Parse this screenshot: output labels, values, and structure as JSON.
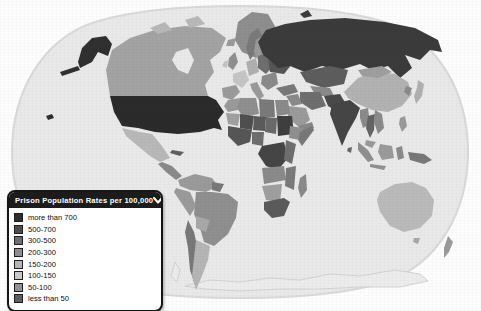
{
  "legend": {
    "title": "Prison Population Rates per 100,000",
    "chevron_icon": "chevron-down",
    "items": [
      {
        "label": "more than 700",
        "color": "#2e2e2e"
      },
      {
        "label": "500-700",
        "color": "#4d4d4d"
      },
      {
        "label": "300-500",
        "color": "#6e6e6e"
      },
      {
        "label": "200-300",
        "color": "#8e8e8e"
      },
      {
        "label": "150-200",
        "color": "#b5b5b5"
      },
      {
        "label": "100-150",
        "color": "#c9c9c9"
      },
      {
        "label": "50-100",
        "color": "#919191"
      },
      {
        "label": "less than 50",
        "color": "#5e5e5e"
      }
    ]
  },
  "map": {
    "projection": "robinson-world",
    "background": "#fdfdfd",
    "ocean": "#e9e9e9",
    "ocean_rim": "#d9d9d9",
    "antarctica_outline": "#d2d2d2",
    "regions": {
      "ocean": "#e9e9e9",
      "alaska": "#303030",
      "usa": "#2b2b2b",
      "hawaii": "#303030",
      "canada": "#a3a3a3",
      "arctic_islands": "#b8b8b8",
      "greenland": "#8e8e8e",
      "iceland": "#9a9a9a",
      "mexico": "#b8b8b8",
      "central_america": "#8a8a8a",
      "cuba": "#5e5e5e",
      "colombia_venezuela": "#9a9a9a",
      "guianas": "#787878",
      "brazil": "#8f8f8f",
      "peru": "#9a9a9a",
      "bolivia": "#a8a8a8",
      "chile": "#787878",
      "argentina": "#b5b5b5",
      "norway": "#7a7a7a",
      "sweden": "#9a9a9a",
      "finland": "#a8a8a8",
      "uk": "#8f8f8f",
      "ireland": "#c2c2c2",
      "france": "#c5c5c5",
      "iberia": "#9a9a9a",
      "central_europe": "#b0b0b0",
      "italy": "#9a9a9a",
      "eastern_europe": "#6e6e6e",
      "ukraine_belarus": "#555555",
      "balkans": "#8a8a8a",
      "russia": "#3b3b3b",
      "turkey": "#787878",
      "kazakhstan": "#5d5d5d",
      "central_asia": "#8a8a8a",
      "afghanistan_pakistan": "#4a4a4a",
      "iran": "#6e6e6e",
      "iraq_syria": "#8a8a8a",
      "saudi_arabia": "#9a9a9a",
      "yemen_oman": "#888888",
      "india": "#454545",
      "sri_lanka": "#666666",
      "china": "#b2b2b2",
      "mongolia": "#9e9e9e",
      "korea": "#8a8a8a",
      "japan": "#b0b0b0",
      "myanmar": "#8a8a8a",
      "thailand": "#646464",
      "vietnam_laos": "#8a8a8a",
      "malaysia": "#9a9a9a",
      "philippines": "#9a9a9a",
      "sumatra_java": "#8f8f8f",
      "borneo": "#9a9a9a",
      "sulawesi": "#8a8a8a",
      "new_guinea": "#787878",
      "australia": "#bababa",
      "tasmania": "#a8a8a8",
      "new_zealand": "#9a9a9a",
      "morocco": "#9a9a9a",
      "algeria": "#8f8f8f",
      "libya": "#7a7a7a",
      "egypt": "#8a8a8a",
      "mauritania": "#a0a0a0",
      "mali": "#4f4f4f",
      "niger": "#5a5a5a",
      "chad": "#6a6a6a",
      "sudan": "#3f3f3f",
      "west_africa": "#565656",
      "nigeria": "#6e6e6e",
      "ethiopia": "#8f8f8f",
      "somalia": "#787878",
      "central_africa": "#454545",
      "east_africa": "#6e6e6e",
      "angola_zambia": "#8a8a8a",
      "mozambique": "#7a7a7a",
      "namibia_botswana": "#9e9e9e",
      "south_africa": "#5a5a5a",
      "madagascar": "#8a8a8a",
      "antarctica": "#ececec"
    }
  }
}
